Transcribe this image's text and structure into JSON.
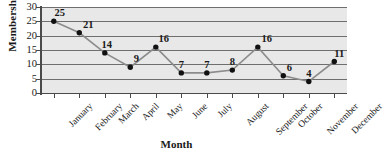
{
  "chart_data": {
    "type": "line",
    "title": "",
    "xlabel": "Month",
    "ylabel": "Memberships",
    "categories": [
      "January",
      "February",
      "March",
      "April",
      "May",
      "June",
      "July",
      "August",
      "September",
      "October",
      "November",
      "December"
    ],
    "values": [
      25,
      21,
      14,
      9,
      16,
      7,
      7,
      8,
      16,
      6,
      4,
      11
    ],
    "point_labels": [
      "25",
      "21",
      "14",
      "9",
      "16",
      "7",
      "7",
      "8",
      "16",
      "6",
      "4",
      "11"
    ],
    "ylim": [
      0,
      30
    ],
    "ytick_labels": [
      "0",
      "5",
      "10",
      "15",
      "20",
      "25",
      "30"
    ],
    "ytick_values": [
      0,
      5,
      10,
      15,
      20,
      25,
      30
    ],
    "grid": "horizontal",
    "legend": "none",
    "colors": {
      "plot_background": "#e8e8e8",
      "gridline": "#6e6e6e",
      "axis": "#4a4a4a",
      "series_line": "#8c8c8c",
      "marker": "#111111",
      "text": "#1a1a1a"
    }
  }
}
